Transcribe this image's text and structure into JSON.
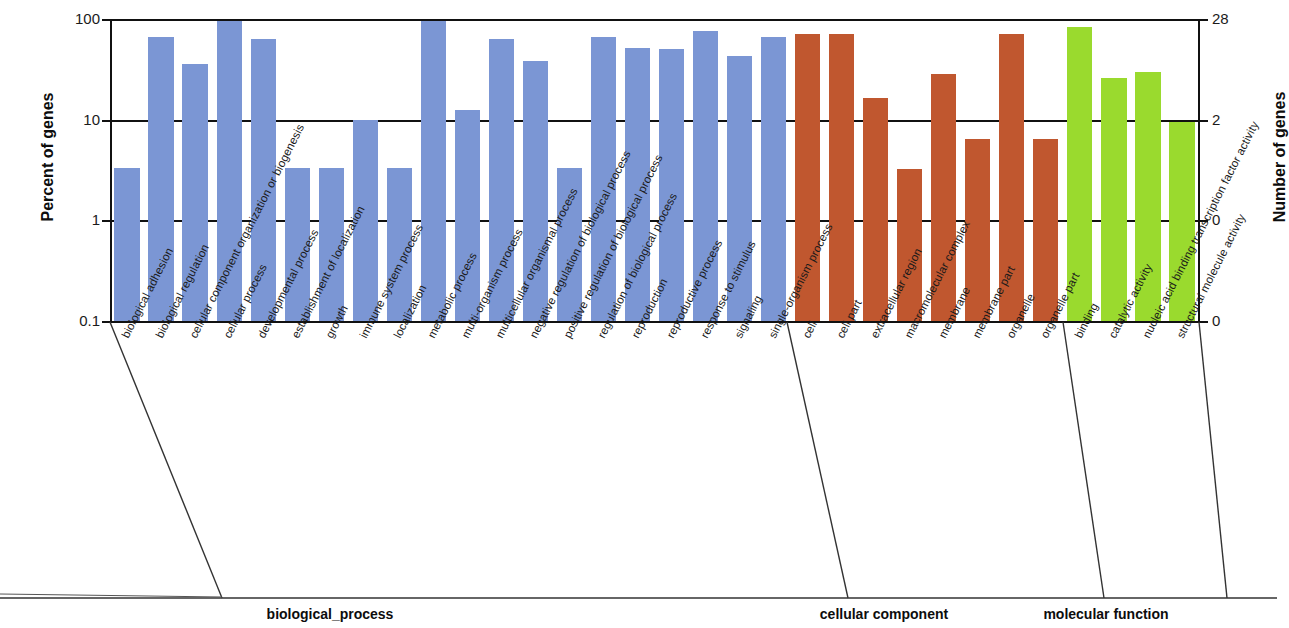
{
  "chart_data": {
    "type": "bar",
    "title": "",
    "xlabel": "",
    "ylabel": "Percent of genes",
    "y2label": "Number of genes",
    "yscale": "log",
    "ylim": [
      0.1,
      100
    ],
    "ytick_labels": [
      "100",
      "10",
      "1",
      "0.1"
    ],
    "ytick_values": [
      100,
      10,
      1,
      0.1
    ],
    "y2tick_labels": [
      "28",
      "2",
      "0",
      "0"
    ],
    "grid": true,
    "legend": "none",
    "colors": {
      "biological_process": "#7b96d4",
      "cellular_component": "#c0572f",
      "molecular_function": "#9ada2e",
      "axis": "#111111",
      "text": "#1a1a1a"
    },
    "groups": [
      {
        "name": "biological_process",
        "label": "biological_process",
        "color": "#7b96d4",
        "categories": [
          "biological adhesion",
          "biological regulation",
          "cellular component organization or biogenesis",
          "cellular process",
          "developmental process",
          "establishment of localization",
          "growth",
          "immune system process",
          "localization",
          "metabolic process",
          "multi-organism process",
          "multicellular organismal process",
          "negative regulation of biological process",
          "positive regulation of biological process",
          "regulation of biological process",
          "reproduction",
          "reproductive process",
          "response to stimulus",
          "signaling",
          "single-organism process"
        ],
        "values": [
          3.5,
          70,
          37,
          100,
          67,
          3.5,
          3.5,
          10.3,
          3.5,
          100,
          13,
          67,
          40,
          3.5,
          70,
          54,
          53,
          80,
          45,
          70
        ]
      },
      {
        "name": "cellular_component",
        "label": "cellular  component",
        "color": "#c0572f",
        "categories": [
          "cell",
          "cell part",
          "extracellular region",
          "macromolecular complex",
          "membrane",
          "membrane part",
          "organelle",
          "organelle part"
        ],
        "values": [
          75,
          75,
          17,
          3.4,
          30,
          6.7,
          75,
          6.7
        ]
      },
      {
        "name": "molecular_function",
        "label": "molecular  function",
        "color": "#9ada2e",
        "categories": [
          "binding",
          "catalytic activity",
          "nucleic acid binding transcription factor activity",
          "structural molecule activity"
        ],
        "values": [
          87,
          27,
          31,
          10
        ]
      }
    ]
  }
}
